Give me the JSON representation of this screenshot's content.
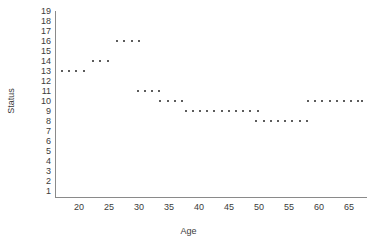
{
  "chart_data": {
    "type": "scatter",
    "title": "",
    "xlabel": "Age",
    "ylabel": "Status",
    "xlim": [
      16,
      68
    ],
    "ylim": [
      1,
      19
    ],
    "grid": false,
    "legend": null,
    "xticks": [
      20,
      25,
      30,
      35,
      40,
      45,
      50,
      55,
      60,
      65
    ],
    "yticks": [
      1,
      2,
      3,
      4,
      5,
      6,
      7,
      8,
      9,
      10,
      11,
      12,
      13,
      14,
      15,
      16,
      17,
      18,
      19
    ],
    "marker": "small-square",
    "marker_color": "#5c5c5c",
    "points": [
      {
        "x": 17.0,
        "y": 13
      },
      {
        "x": 18.2,
        "y": 13
      },
      {
        "x": 19.4,
        "y": 13
      },
      {
        "x": 20.6,
        "y": 13
      },
      {
        "x": 22.2,
        "y": 14
      },
      {
        "x": 23.4,
        "y": 14
      },
      {
        "x": 24.6,
        "y": 14
      },
      {
        "x": 26.2,
        "y": 16
      },
      {
        "x": 27.4,
        "y": 16
      },
      {
        "x": 28.6,
        "y": 16
      },
      {
        "x": 29.8,
        "y": 16
      },
      {
        "x": 29.6,
        "y": 11
      },
      {
        "x": 30.8,
        "y": 11
      },
      {
        "x": 32.0,
        "y": 11
      },
      {
        "x": 33.2,
        "y": 11
      },
      {
        "x": 33.4,
        "y": 10
      },
      {
        "x": 34.6,
        "y": 10
      },
      {
        "x": 35.8,
        "y": 10
      },
      {
        "x": 37.0,
        "y": 10
      },
      {
        "x": 37.6,
        "y": 9
      },
      {
        "x": 38.8,
        "y": 9
      },
      {
        "x": 40.0,
        "y": 9
      },
      {
        "x": 41.2,
        "y": 9
      },
      {
        "x": 42.4,
        "y": 9
      },
      {
        "x": 43.6,
        "y": 9
      },
      {
        "x": 44.8,
        "y": 9
      },
      {
        "x": 46.0,
        "y": 9
      },
      {
        "x": 47.2,
        "y": 9
      },
      {
        "x": 48.4,
        "y": 9
      },
      {
        "x": 49.6,
        "y": 9
      },
      {
        "x": 49.4,
        "y": 8
      },
      {
        "x": 50.6,
        "y": 8
      },
      {
        "x": 51.8,
        "y": 8
      },
      {
        "x": 53.0,
        "y": 8
      },
      {
        "x": 54.2,
        "y": 8
      },
      {
        "x": 55.4,
        "y": 8
      },
      {
        "x": 56.6,
        "y": 8
      },
      {
        "x": 57.8,
        "y": 8
      },
      {
        "x": 58.0,
        "y": 10
      },
      {
        "x": 59.2,
        "y": 10
      },
      {
        "x": 60.4,
        "y": 10
      },
      {
        "x": 61.6,
        "y": 10
      },
      {
        "x": 62.8,
        "y": 10
      },
      {
        "x": 64.0,
        "y": 10
      },
      {
        "x": 65.2,
        "y": 10
      },
      {
        "x": 66.4,
        "y": 10
      },
      {
        "x": 67.0,
        "y": 10
      }
    ]
  }
}
